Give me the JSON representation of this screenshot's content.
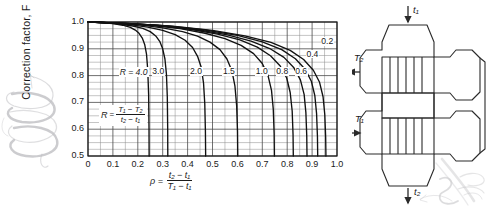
{
  "chart_data": {
    "type": "line",
    "title": "",
    "xlabel": "ρ = (t₂ − t₁) / (T₁ − t₁)",
    "ylabel": "Correction factor, F",
    "xlim": [
      0.0,
      1.0
    ],
    "ylim": [
      0.5,
      1.0
    ],
    "grid": true,
    "xtick_labels": [
      "0",
      "0.1",
      "0.2",
      "0.3",
      "0.4",
      "0.5",
      "0.6",
      "0.7",
      "0.8",
      "0.9",
      "1.0"
    ],
    "xtick_values": [
      0.0,
      0.1,
      0.2,
      0.3,
      0.4,
      0.5,
      0.6,
      0.7,
      0.8,
      0.9,
      1.0
    ],
    "ytick_labels": [
      "0.5",
      "0.6",
      "0.7",
      "0.8",
      "0.9",
      "1.0"
    ],
    "ytick_values": [
      0.5,
      0.6,
      0.7,
      0.8,
      0.9,
      1.0
    ],
    "minor_grid_step_x": 0.05,
    "minor_grid_step_y": 0.025,
    "legend_position": "inline-curve-labels",
    "annotation": "R = (T₁ − T₂) / (t₂ − t₁)",
    "series": [
      {
        "name": "4.0",
        "x": [
          0.0,
          0.05,
          0.1,
          0.14,
          0.17,
          0.19,
          0.205,
          0.218,
          0.228,
          0.235,
          0.24,
          0.2435,
          0.245,
          0.2455
        ],
        "y": [
          1.0,
          0.998,
          0.994,
          0.988,
          0.98,
          0.97,
          0.958,
          0.94,
          0.915,
          0.88,
          0.82,
          0.73,
          0.61,
          0.5
        ]
      },
      {
        "name": "3.0",
        "x": [
          0.0,
          0.06,
          0.12,
          0.18,
          0.22,
          0.25,
          0.272,
          0.288,
          0.3,
          0.309,
          0.315,
          0.3185,
          0.32,
          0.3205
        ],
        "y": [
          1.0,
          0.998,
          0.993,
          0.985,
          0.976,
          0.964,
          0.948,
          0.928,
          0.9,
          0.862,
          0.805,
          0.72,
          0.605,
          0.5
        ]
      },
      {
        "name": "2.0",
        "x": [
          0.0,
          0.08,
          0.16,
          0.24,
          0.3,
          0.35,
          0.39,
          0.42,
          0.44,
          0.455,
          0.464,
          0.469,
          0.4715,
          0.4725
        ],
        "y": [
          1.0,
          0.997,
          0.991,
          0.981,
          0.969,
          0.953,
          0.932,
          0.905,
          0.872,
          0.83,
          0.772,
          0.695,
          0.595,
          0.5
        ]
      },
      {
        "name": "1.5",
        "x": [
          0.0,
          0.1,
          0.2,
          0.3,
          0.38,
          0.44,
          0.49,
          0.53,
          0.558,
          0.578,
          0.59,
          0.597,
          0.6005,
          0.6015
        ],
        "y": [
          1.0,
          0.997,
          0.99,
          0.978,
          0.964,
          0.947,
          0.925,
          0.897,
          0.862,
          0.818,
          0.762,
          0.688,
          0.592,
          0.5
        ]
      },
      {
        "name": "1.0",
        "x": [
          0.0,
          0.12,
          0.25,
          0.37,
          0.47,
          0.55,
          0.615,
          0.665,
          0.7,
          0.723,
          0.737,
          0.744,
          0.7475,
          0.7485
        ],
        "y": [
          1.0,
          0.996,
          0.988,
          0.975,
          0.958,
          0.938,
          0.913,
          0.882,
          0.845,
          0.8,
          0.745,
          0.675,
          0.585,
          0.5
        ]
      },
      {
        "name": "0.8",
        "x": [
          0.0,
          0.14,
          0.28,
          0.41,
          0.52,
          0.61,
          0.68,
          0.733,
          0.772,
          0.798,
          0.812,
          0.82,
          0.8235,
          0.8245
        ],
        "y": [
          1.0,
          0.996,
          0.987,
          0.973,
          0.955,
          0.933,
          0.906,
          0.874,
          0.836,
          0.791,
          0.737,
          0.668,
          0.58,
          0.5
        ]
      },
      {
        "name": "0.6",
        "x": [
          0.0,
          0.15,
          0.3,
          0.44,
          0.56,
          0.655,
          0.73,
          0.787,
          0.827,
          0.853,
          0.868,
          0.875,
          0.8785,
          0.8795
        ],
        "y": [
          1.0,
          0.995,
          0.986,
          0.971,
          0.952,
          0.929,
          0.901,
          0.868,
          0.829,
          0.784,
          0.73,
          0.662,
          0.576,
          0.5
        ]
      },
      {
        "name": "0.4",
        "x": [
          0.0,
          0.16,
          0.32,
          0.47,
          0.6,
          0.7,
          0.778,
          0.833,
          0.872,
          0.897,
          0.911,
          0.918,
          0.9215,
          0.9225
        ],
        "y": [
          1.0,
          0.995,
          0.985,
          0.97,
          0.95,
          0.926,
          0.897,
          0.863,
          0.824,
          0.779,
          0.725,
          0.658,
          0.573,
          0.5
        ]
      },
      {
        "name": "0.2",
        "x": [
          0.0,
          0.17,
          0.34,
          0.5,
          0.63,
          0.735,
          0.812,
          0.866,
          0.905,
          0.93,
          0.944,
          0.951,
          0.9545,
          0.9555
        ],
        "y": [
          1.0,
          0.994,
          0.984,
          0.969,
          0.948,
          0.924,
          0.894,
          0.86,
          0.82,
          0.775,
          0.721,
          0.654,
          0.57,
          0.5
        ]
      }
    ],
    "curve_labels": [
      {
        "text": "R = 4.0",
        "x": 0.123,
        "y": 0.812,
        "kind": "r-first"
      },
      {
        "text": "3.0",
        "x": 0.256,
        "y": 0.812,
        "kind": "plain"
      },
      {
        "text": "2.0",
        "x": 0.408,
        "y": 0.812,
        "kind": "plain"
      },
      {
        "text": "1.5",
        "x": 0.54,
        "y": 0.812,
        "kind": "plain"
      },
      {
        "text": "1.0",
        "x": 0.672,
        "y": 0.812,
        "kind": "plain"
      },
      {
        "text": "0.8",
        "x": 0.754,
        "y": 0.812,
        "kind": "plain"
      },
      {
        "text": "0.6",
        "x": 0.83,
        "y": 0.812,
        "kind": "plain"
      },
      {
        "text": "0.4",
        "x": 0.875,
        "y": 0.878,
        "kind": "plain"
      },
      {
        "text": "0.2",
        "x": 0.935,
        "y": 0.925,
        "kind": "plain"
      }
    ]
  },
  "chart": {
    "ylabel": "Correction factor, F",
    "r_annotation": {
      "symbol": "R",
      "equals": "=",
      "numerator": "T₁ − T₂",
      "denominator": "t₂ − t₁"
    },
    "x_caption": {
      "symbol": "ρ =",
      "numerator": "t₂ − t₁",
      "denominator": "T₁ − t₁"
    }
  },
  "exchanger": {
    "name": "two-shell-pass-four-tube-pass-exchanger",
    "labels": {
      "top_inlet": "t₁",
      "bottom_outlet": "t₂",
      "left_upper": "T₂",
      "left_lower": "T₁"
    }
  },
  "colors": {
    "ink": "#1a1a1a",
    "grid": "#6f6f6f",
    "curve": "#111111",
    "pencil": "#8d8d93",
    "paper": "#ffffff"
  }
}
